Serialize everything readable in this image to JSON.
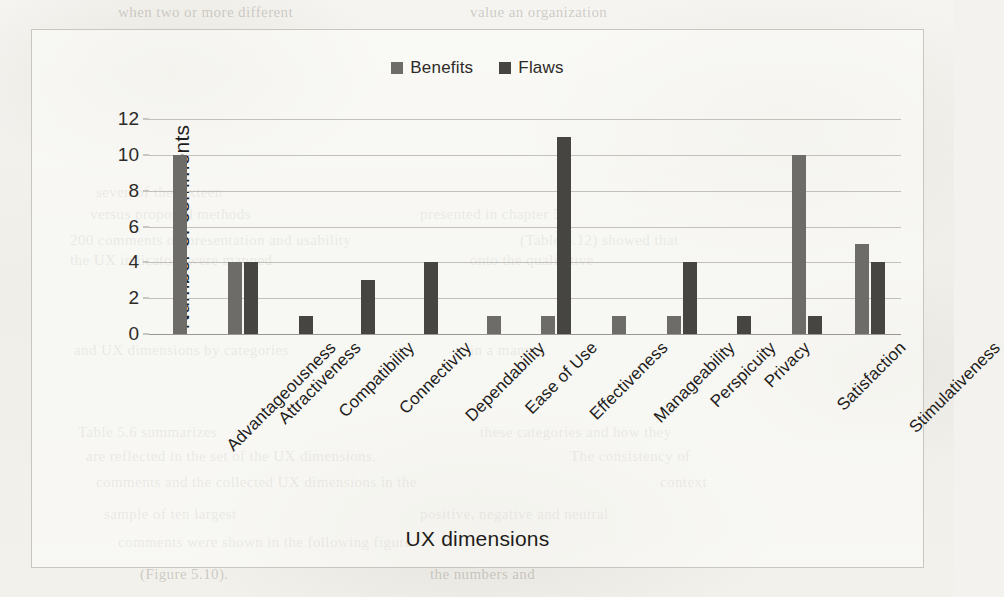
{
  "chart_data": {
    "type": "bar",
    "title": "",
    "xlabel": "UX dimensions",
    "ylabel": "Number of comments",
    "ylim": [
      0,
      12
    ],
    "yticks": [
      0,
      2,
      4,
      6,
      8,
      10,
      12
    ],
    "grid": true,
    "legend_position": "top-center",
    "categories": [
      "Advantageousness",
      "Attractiveness",
      "Compatibility",
      "Connectivity",
      "Dependability",
      "Ease of Use",
      "Effectiveness",
      "Manageability",
      "Perspicuity",
      "Privacy",
      "Satisfaction",
      "Stimulativeness"
    ],
    "series": [
      {
        "name": "Benefits",
        "color": "#6e6c68",
        "values": [
          10,
          4,
          0,
          0,
          0,
          1,
          1,
          1,
          1,
          0,
          10,
          5
        ]
      },
      {
        "name": "Flaws",
        "color": "#474542",
        "values": [
          0,
          4,
          1,
          3,
          4,
          0,
          11,
          0,
          4,
          1,
          1,
          4
        ]
      }
    ]
  },
  "background_bleed": [
    {
      "text": "when      two       or more      different",
      "x": 118,
      "y": 4
    },
    {
      "text": "value      an        organization",
      "x": 470,
      "y": 4
    },
    {
      "text": "seven       of       the  sixteen",
      "x": 96,
      "y": 184
    },
    {
      "text": "versus        proposed       methods",
      "x": 90,
      "y": 206
    },
    {
      "text": "presented       in      chapter 5",
      "x": 420,
      "y": 206
    },
    {
      "text": "200 comments     on    presentation  and  usability",
      "x": 70,
      "y": 232
    },
    {
      "text": "(Table 5.12) showed that",
      "x": 520,
      "y": 232
    },
    {
      "text": "the     UX        indicators      were     mapped",
      "x": 70,
      "y": 252
    },
    {
      "text": "onto     the     qualitative",
      "x": 470,
      "y": 252
    },
    {
      "text": "and     UX       dimensions       by      categories",
      "x": 74,
      "y": 342
    },
    {
      "text": "in    a     manner",
      "x": 470,
      "y": 342
    },
    {
      "text": "Table 5.6 summarizes",
      "x": 78,
      "y": 424
    },
    {
      "text": "these categories and how they",
      "x": 480,
      "y": 424
    },
    {
      "text": "are reflected in the set of the UX dimensions.",
      "x": 86,
      "y": 448
    },
    {
      "text": "The consistency of",
      "x": 570,
      "y": 448
    },
    {
      "text": "comments  and  the  collected  UX  dimensions  in  the",
      "x": 96,
      "y": 474
    },
    {
      "text": "context",
      "x": 660,
      "y": 474
    },
    {
      "text": "sample     of      ten       largest",
      "x": 104,
      "y": 506
    },
    {
      "text": "positive,    negative    and    neutral",
      "x": 420,
      "y": 506
    },
    {
      "text": "comments    were    shown    in    the    following    figure",
      "x": 118,
      "y": 534
    },
    {
      "text": "(Figure 5.10).",
      "x": 140,
      "y": 566
    },
    {
      "text": "the     numbers    and",
      "x": 430,
      "y": 566
    }
  ]
}
